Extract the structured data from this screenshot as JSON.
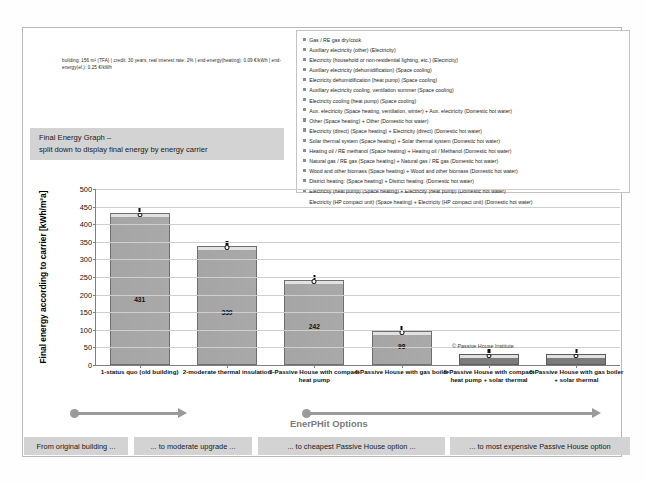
{
  "assumptions": "building: 156 m² (TFA) | credit: 30 years,  real interest rate: 2%  | end-energy(heating): 0.09 €/kWh  |  end-energy(el.): 0.25 €/kWh",
  "callout": {
    "line1": "Final Energy Graph –",
    "line2": "split down to display final energy by energy carrier"
  },
  "legend": {
    "items": [
      "Gas / RE gas dry/cook",
      "Auxiliary electricity (other) (Electricity)",
      "Electricity (household or non-residential lighting, etc.) (Electricity)",
      "Auxiliary electricity (dehumidification) (Space cooling)",
      "Electricity dehumidification (heat pump) (Space cooling)",
      "Auxiliary electricity cooling, ventilation summer (Space cooling)",
      "Electricity cooling (heat pump) (Space cooling)",
      "Aux. electricity (Space heating, ventilation, winter)  +  Aux. electricity (Domestic hot water)",
      "Other (Space heating)  +  Other (Domestic hot water)",
      "Electricity (direct) (Space heating)  +  Electricity (direct) (Domestic hot water)",
      "Solar thermal system (Space heating)  +  Solar thermal system (Domestic hot water)",
      "Heating oil / RE methanol (Space heating)  +  Heating oil / Methanol (Domestic hot water)",
      "Natural gas / RE gas (Space heating)  +  Natural gas / RE gas (Domestic hot water)",
      "Wood and other biomass (Space heating)  +  Wood and other biomass (Domestic hot water)",
      "District heating: (Space heating)  +  District heating:  (Domestic hot water)",
      "Electricity (heat pump) (Space heating)  +  Electricity (heat pump) (Domestic hot water)",
      "Electricity (HP compact unit) (Space heating)  +  Electricity (HP compact unit) (Domestic hot water)"
    ]
  },
  "chart_data": {
    "type": "bar",
    "title": "",
    "xlabel": "",
    "ylabel": "Final energy according to carrier [kWh/m²a]",
    "ylim": [
      0,
      500
    ],
    "yticks": [
      0,
      50,
      100,
      150,
      200,
      250,
      300,
      350,
      400,
      450,
      500
    ],
    "grid": true,
    "legend_position": "top-right",
    "categories": [
      "1-status quo (old building)",
      "2-moderate thermal insulation",
      "3-Passive House with compact heat pump",
      "4-Passive House with gas boiler",
      "5-Passive House with compact heat pump + solar thermal",
      "6-Passive House with gas boiler + solar thermal"
    ],
    "values": [
      431,
      339,
      242,
      98,
      30,
      30
    ],
    "value_labels": [
      "431",
      "339",
      "242",
      "98",
      "",
      ""
    ],
    "bar_color": "#a7a7a7",
    "copyright": "© Passive House Institute"
  },
  "progress": {
    "enerphit_label": "EnerPHit Options"
  },
  "chips": [
    "From original building ...",
    "... to moderate upgrade ...",
    "... to cheapest Passive House option ...",
    "... to most expensive Passive House option"
  ]
}
